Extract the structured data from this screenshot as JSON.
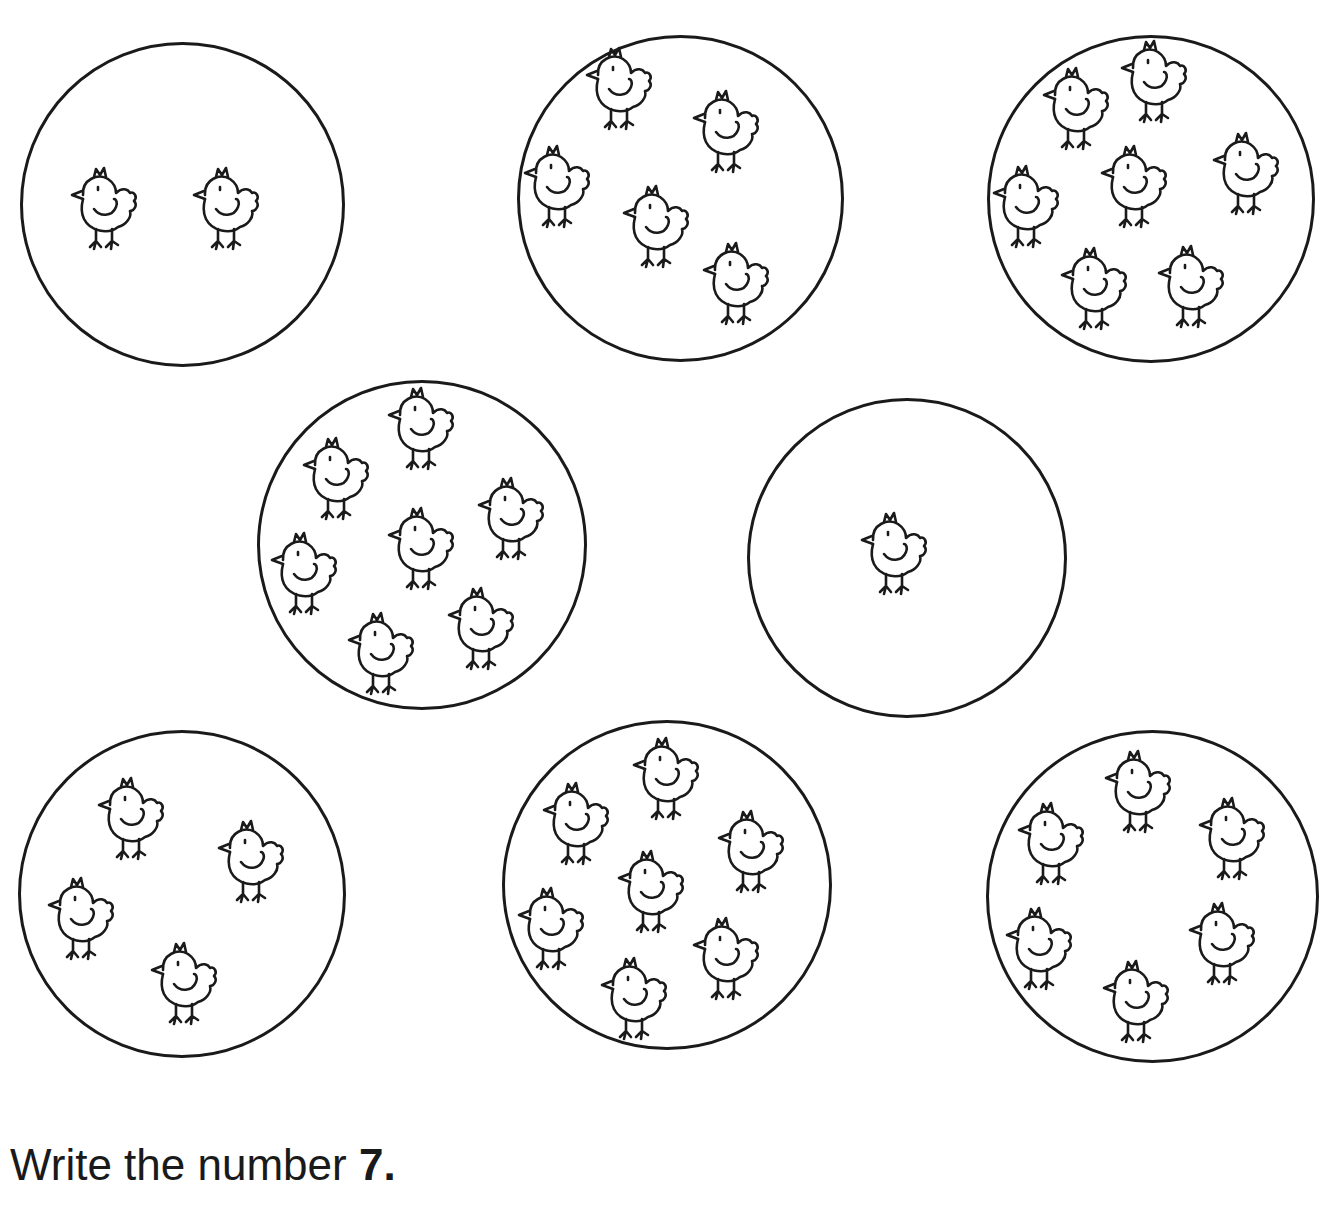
{
  "worksheet": {
    "instruction_prefix": "Write the number",
    "instruction_number": "7."
  },
  "circles": [
    {
      "id": "c1",
      "x": 20,
      "y": 42,
      "d": 325,
      "count": 2,
      "chicks": [
        [
          68,
          165
        ],
        [
          190,
          165
        ]
      ]
    },
    {
      "id": "c2",
      "x": 517,
      "y": 35,
      "d": 327,
      "count": 5,
      "chicks": [
        [
          583,
          45
        ],
        [
          690,
          88
        ],
        [
          521,
          143
        ],
        [
          620,
          183
        ],
        [
          700,
          240
        ]
      ]
    },
    {
      "id": "c3",
      "x": 987,
      "y": 35,
      "d": 328,
      "count": 7,
      "chicks": [
        [
          1040,
          65
        ],
        [
          1118,
          38
        ],
        [
          990,
          163
        ],
        [
          1098,
          143
        ],
        [
          1210,
          130
        ],
        [
          1058,
          245
        ],
        [
          1155,
          243
        ]
      ]
    },
    {
      "id": "c4",
      "x": 257,
      "y": 380,
      "d": 330,
      "count": 8,
      "chicks": [
        [
          300,
          435
        ],
        [
          385,
          385
        ],
        [
          268,
          530
        ],
        [
          385,
          505
        ],
        [
          475,
          475
        ],
        [
          345,
          610
        ],
        [
          445,
          585
        ]
      ]
    },
    {
      "id": "c5",
      "x": 747,
      "y": 398,
      "d": 320,
      "count": 1,
      "chicks": [
        [
          858,
          510
        ]
      ]
    },
    {
      "id": "c6",
      "x": 18,
      "y": 730,
      "d": 328,
      "count": 4,
      "chicks": [
        [
          95,
          775
        ],
        [
          215,
          818
        ],
        [
          45,
          875
        ],
        [
          148,
          940
        ]
      ]
    },
    {
      "id": "c7",
      "x": 502,
      "y": 720,
      "d": 330,
      "count": 8,
      "chicks": [
        [
          540,
          780
        ],
        [
          630,
          735
        ],
        [
          515,
          885
        ],
        [
          615,
          848
        ],
        [
          715,
          808
        ],
        [
          598,
          955
        ],
        [
          690,
          915
        ]
      ]
    },
    {
      "id": "c8",
      "x": 986,
      "y": 730,
      "d": 333,
      "count": 6,
      "chicks": [
        [
          1102,
          748
        ],
        [
          1015,
          800
        ],
        [
          1196,
          795
        ],
        [
          1003,
          905
        ],
        [
          1186,
          900
        ],
        [
          1100,
          958
        ]
      ]
    }
  ]
}
